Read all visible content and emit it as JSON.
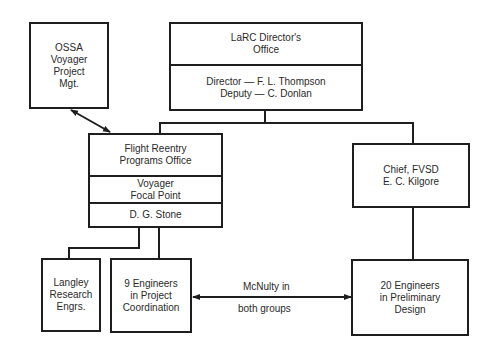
{
  "diagram": {
    "nodes": {
      "ossa": {
        "text": "OSSA\nVoyager\nProject\nMgt."
      },
      "larc": {
        "title": "LaRC Director's\nOffice",
        "staff": "Director — F. L. Thompson\nDeputy — C. Donlan"
      },
      "flight": {
        "title": "Flight Reentry\nPrograms Office",
        "role": "Voyager\nFocal Point",
        "head": "D. G. Stone"
      },
      "chief": {
        "text": "Chief, FVSD\nE. C. Kilgore"
      },
      "langley": {
        "text": "Langley\nResearch\nEngrs."
      },
      "nine": {
        "text": "9 Engineers\nin Project\nCoordination"
      },
      "twenty": {
        "text": "20 Engineers\nin Preliminary\nDesign"
      }
    },
    "edge_labels": {
      "mcnulty_top": "McNulty in",
      "mcnulty_bottom": "both groups"
    },
    "edges": [
      {
        "from": "larc",
        "to": "flight",
        "type": "line"
      },
      {
        "from": "larc",
        "to": "chief",
        "type": "line"
      },
      {
        "from": "ossa",
        "to": "flight",
        "type": "double-arrow"
      },
      {
        "from": "flight",
        "to": "langley",
        "type": "line"
      },
      {
        "from": "flight",
        "to": "nine",
        "type": "line"
      },
      {
        "from": "chief",
        "to": "twenty",
        "type": "line"
      },
      {
        "from": "nine",
        "to": "twenty",
        "type": "double-arrow",
        "label": "McNulty in both groups"
      }
    ]
  }
}
